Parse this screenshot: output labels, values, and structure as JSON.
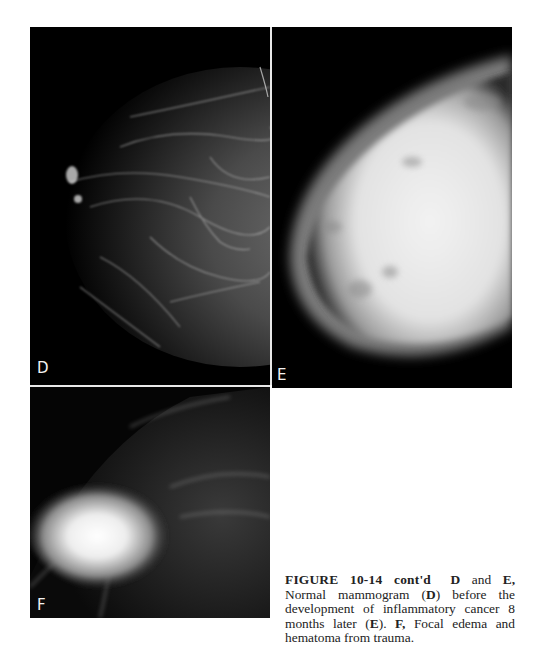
{
  "figure": {
    "panels": [
      {
        "id": "D",
        "label": "D",
        "description": "Normal mammogram"
      },
      {
        "id": "E",
        "label": "E",
        "description": "Inflammatory cancer 8 months later"
      },
      {
        "id": "F",
        "label": "F",
        "description": "Focal edema and hematoma from trauma"
      }
    ],
    "caption": {
      "number": "FIGURE 10-14 cont'd",
      "seg1_bold": "D",
      "seg2": " and ",
      "seg3_bold": "E,",
      "seg4": " Normal mammogram (",
      "seg5_bold": "D",
      "seg6": ") before the development of inflammatory cancer 8 months later (",
      "seg7_bold": "E",
      "seg8": "). ",
      "seg9_bold": "F,",
      "seg10": " Focal edema and hematoma from trauma."
    }
  }
}
